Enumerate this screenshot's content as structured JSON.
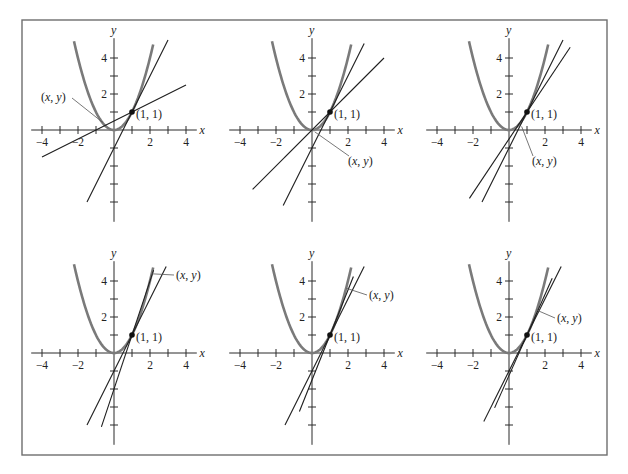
{
  "figure": {
    "border": {
      "x": 22,
      "y": 20,
      "w": 585,
      "h": 435,
      "color": "#6e6e6e"
    },
    "scale_px_per_unit": 18,
    "axis_labels": {
      "x": "x",
      "y": "y"
    },
    "x_tick_labels": [
      {
        "v": -4,
        "t": "−4"
      },
      {
        "v": -2,
        "t": "−2"
      },
      {
        "v": 2,
        "t": "2"
      },
      {
        "v": 4,
        "t": "4"
      }
    ],
    "y_tick_labels": [
      {
        "v": 2,
        "t": "2"
      },
      {
        "v": 4,
        "t": "4"
      }
    ],
    "point_label": "(1, 1)",
    "moving_point_label": "(x, y)",
    "colors": {
      "parabola": "#7a7a7a",
      "lines": "#1e1e1e",
      "text": "#222222"
    }
  },
  "chart_data": [
    {
      "type": "line",
      "title": "",
      "panel": 1,
      "curve": "y = x^2",
      "fixed_point": [
        1,
        1
      ],
      "secant_x": -0.5,
      "lines": [
        {
          "name": "secant",
          "slope": 0.5,
          "intercept": 0.5,
          "x_range": [
            -4,
            4
          ]
        },
        {
          "name": "tangent",
          "slope": 2,
          "intercept": -1,
          "x_range": [
            -1.5,
            3
          ]
        }
      ],
      "label": "(x, y)",
      "xlim": [
        -4,
        4
      ],
      "ylim": [
        -5,
        5
      ]
    },
    {
      "type": "line",
      "title": "",
      "panel": 2,
      "curve": "y = x^2",
      "fixed_point": [
        1,
        1
      ],
      "secant_x": 0,
      "lines": [
        {
          "name": "secant",
          "slope": 1,
          "intercept": 0,
          "x_range": [
            -3.3,
            4
          ]
        },
        {
          "name": "tangent",
          "slope": 2,
          "intercept": -1,
          "x_range": [
            -1.6,
            2.9
          ]
        }
      ],
      "label": "(x, y)",
      "xlim": [
        -4,
        4
      ],
      "ylim": [
        -5,
        5
      ]
    },
    {
      "type": "line",
      "title": "",
      "panel": 3,
      "curve": "y = x^2",
      "fixed_point": [
        1,
        1
      ],
      "secant_x": 0.5,
      "lines": [
        {
          "name": "secant",
          "slope": 1.5,
          "intercept": -0.5,
          "x_range": [
            -2.2,
            3.4
          ]
        },
        {
          "name": "tangent",
          "slope": 2,
          "intercept": -1,
          "x_range": [
            -1.5,
            3
          ]
        }
      ],
      "label": "(x, y)",
      "xlim": [
        -4,
        4
      ],
      "ylim": [
        -5,
        5
      ]
    },
    {
      "type": "line",
      "title": "",
      "panel": 4,
      "curve": "y = x^2",
      "fixed_point": [
        1,
        1
      ],
      "secant_x": 2,
      "lines": [
        {
          "name": "secant",
          "slope": 3,
          "intercept": -2,
          "x_range": [
            -0.7,
            2.2
          ]
        },
        {
          "name": "tangent",
          "slope": 2,
          "intercept": -1,
          "x_range": [
            -1.5,
            2.9
          ]
        }
      ],
      "label": "(x, y)",
      "xlim": [
        -4,
        4
      ],
      "ylim": [
        -5,
        5
      ]
    },
    {
      "type": "line",
      "title": "",
      "panel": 5,
      "curve": "y = x^2",
      "fixed_point": [
        1,
        1
      ],
      "secant_x": 1.5,
      "lines": [
        {
          "name": "secant",
          "slope": 2.5,
          "intercept": -1.5,
          "x_range": [
            -0.7,
            2.3
          ]
        },
        {
          "name": "tangent",
          "slope": 2,
          "intercept": -1,
          "x_range": [
            -1.5,
            2.9
          ]
        }
      ],
      "label": "(x, y)",
      "xlim": [
        -4,
        4
      ],
      "ylim": [
        -5,
        5
      ]
    },
    {
      "type": "line",
      "title": "",
      "panel": 6,
      "curve": "y = x^2",
      "fixed_point": [
        1,
        1
      ],
      "secant_x": 1.25,
      "lines": [
        {
          "name": "secant",
          "slope": 2.25,
          "intercept": -1.25,
          "x_range": [
            -0.8,
            2.4
          ]
        },
        {
          "name": "tangent",
          "slope": 2,
          "intercept": -1,
          "x_range": [
            -1.4,
            2.9
          ]
        }
      ],
      "label": "(x, y)",
      "xlim": [
        -4,
        4
      ],
      "ylim": [
        -5,
        5
      ]
    }
  ],
  "panels": [
    {
      "ox": 114,
      "oy": 130,
      "label_pos": [
        41,
        101
      ],
      "leader_to": [
        -0.6,
        0.4
      ]
    },
    {
      "ox": 312,
      "oy": 130,
      "label_pos": [
        348,
        165
      ],
      "leader_to": [
        0.15,
        -0.1
      ]
    },
    {
      "ox": 509,
      "oy": 130,
      "label_pos": [
        532,
        165
      ],
      "leader_to": [
        0.7,
        0.2
      ]
    },
    {
      "ox": 114,
      "oy": 353,
      "label_pos": [
        176,
        279
      ],
      "leader_to": [
        2.1,
        4.4
      ]
    },
    {
      "ox": 312,
      "oy": 353,
      "label_pos": [
        369,
        299
      ],
      "leader_to": [
        1.9,
        3.6
      ]
    },
    {
      "ox": 509,
      "oy": 353,
      "label_pos": [
        557,
        322
      ],
      "leader_to": [
        1.5,
        2.4
      ]
    }
  ]
}
